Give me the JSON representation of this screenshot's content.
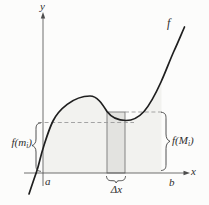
{
  "figure": {
    "y_axis_label": "y",
    "x_axis_label": "x",
    "a_label": "a",
    "b_label": "b",
    "f_label": "f",
    "delta_x_label": "Δx",
    "f_m_label": {
      "prefix": "f(m",
      "sub": "i",
      "suffix": ")"
    },
    "f_M_label": {
      "prefix": "f(M",
      "sub": "i",
      "suffix": ")"
    },
    "colors": {
      "background": "#fcfcfb",
      "curve": "#1f1f1f",
      "region_fill": "#f2f2ef",
      "strip_fill": "#e3e3e0",
      "strip_stroke": "#787878",
      "dashed": "#9b9b9b",
      "axis": "#4d4d4d",
      "brace": "#3f3f3f",
      "label": "#2e2e2e"
    }
  }
}
